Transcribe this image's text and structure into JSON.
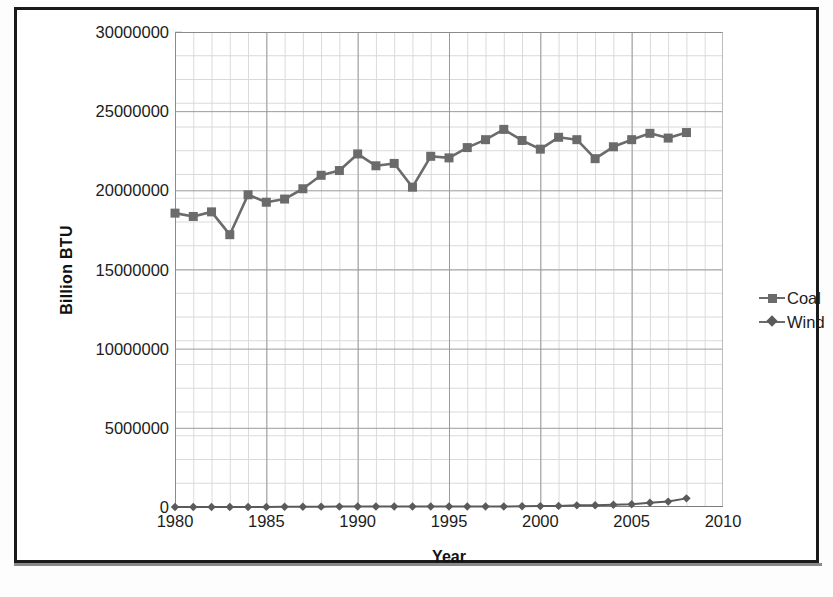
{
  "chart_data": {
    "type": "line",
    "title": "",
    "xlabel": "Year",
    "ylabel": "Billion BTU",
    "xlim": [
      1980,
      2010
    ],
    "ylim": [
      0,
      30000000
    ],
    "xticks": [
      1980,
      1985,
      1990,
      1995,
      2000,
      2005,
      2010
    ],
    "yticks": [
      0,
      5000000,
      10000000,
      15000000,
      20000000,
      25000000,
      30000000
    ],
    "ytick_labels": [
      "0",
      "5000000",
      "10000000",
      "15000000",
      "20000000",
      "25000000",
      "30000000"
    ],
    "xtick_labels": [
      "1980",
      "1985",
      "1990",
      "1995",
      "2000",
      "2005",
      "2010"
    ],
    "grid": true,
    "minor_grid": true,
    "legend_position": "right",
    "x": [
      1980,
      1981,
      1982,
      1983,
      1984,
      1985,
      1986,
      1987,
      1988,
      1989,
      1990,
      1991,
      1992,
      1993,
      1994,
      1995,
      1996,
      1997,
      1998,
      1999,
      2000,
      2001,
      2002,
      2003,
      2004,
      2005,
      2006,
      2007,
      2008
    ],
    "series": [
      {
        "name": "Coal",
        "marker": "square",
        "color": "#6b6b6b",
        "values": [
          18560000,
          18350000,
          18640000,
          17200000,
          19720000,
          19250000,
          19450000,
          20100000,
          20950000,
          21250000,
          22300000,
          21550000,
          21700000,
          20200000,
          22150000,
          22050000,
          22700000,
          23200000,
          23850000,
          23150000,
          22600000,
          23350000,
          23200000,
          22000000,
          22750000,
          23200000,
          23600000,
          23300000,
          23650000
        ]
      },
      {
        "name": "Wind",
        "marker": "diamond",
        "color": "#5a5a5a",
        "values": [
          0,
          0,
          0,
          0,
          1000,
          6000,
          12000,
          18000,
          22000,
          25000,
          29000,
          30000,
          32000,
          32000,
          36000,
          33000,
          33000,
          34000,
          31000,
          46000,
          57000,
          68000,
          105000,
          115000,
          142000,
          178000,
          264000,
          341000,
          546000
        ]
      }
    ]
  },
  "legend": {
    "items": [
      {
        "label": "Coal",
        "marker": "square"
      },
      {
        "label": "Wind",
        "marker": "diamond"
      }
    ]
  }
}
